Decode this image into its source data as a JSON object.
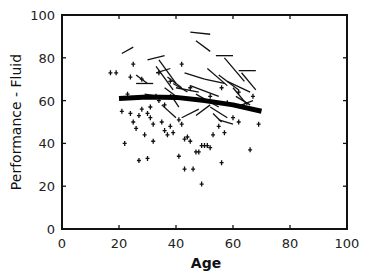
{
  "chart_data": {
    "type": "scatter",
    "title": "",
    "xlabel": "Age",
    "ylabel": "Performance - Fluid",
    "xlim": [
      0,
      100
    ],
    "ylim": [
      0,
      100
    ],
    "xticks": [
      0,
      20,
      40,
      60,
      80,
      100
    ],
    "yticks": [
      0,
      20,
      40,
      60,
      80,
      100
    ],
    "grid": false,
    "legend": null,
    "series": [
      {
        "name": "single observations",
        "marker": "plus",
        "points": [
          [
            17,
            73
          ],
          [
            19,
            73
          ],
          [
            21,
            55
          ],
          [
            24,
            54
          ],
          [
            25,
            50
          ],
          [
            26,
            47
          ],
          [
            27,
            53
          ],
          [
            28,
            56
          ],
          [
            29,
            44
          ],
          [
            30,
            54
          ],
          [
            31,
            57
          ],
          [
            31,
            52
          ],
          [
            32,
            49
          ],
          [
            32,
            41
          ],
          [
            33,
            62
          ],
          [
            34,
            60
          ],
          [
            35,
            50
          ],
          [
            36,
            46
          ],
          [
            37,
            44
          ],
          [
            38,
            48
          ],
          [
            39,
            45
          ],
          [
            41,
            51
          ],
          [
            42,
            49
          ],
          [
            43,
            42
          ],
          [
            44,
            43
          ],
          [
            45,
            41
          ],
          [
            47,
            36
          ],
          [
            48,
            36
          ],
          [
            49,
            39
          ],
          [
            50,
            39
          ],
          [
            51,
            39
          ],
          [
            52,
            38
          ],
          [
            53,
            44
          ],
          [
            55,
            48
          ],
          [
            56,
            31
          ],
          [
            57,
            45
          ],
          [
            60,
            52
          ],
          [
            62,
            50
          ],
          [
            66,
            37
          ],
          [
            69,
            49
          ],
          [
            22,
            40
          ],
          [
            27,
            32
          ],
          [
            30,
            33
          ],
          [
            43,
            28
          ],
          [
            46,
            28
          ],
          [
            49,
            21
          ],
          [
            41,
            34
          ],
          [
            36,
            58
          ],
          [
            23,
            63
          ],
          [
            24,
            71
          ],
          [
            25,
            77
          ],
          [
            28,
            70
          ],
          [
            34,
            73
          ],
          [
            38,
            69
          ],
          [
            42,
            77
          ],
          [
            45,
            66
          ],
          [
            52,
            62
          ],
          [
            56,
            66
          ],
          [
            58,
            59
          ],
          [
            62,
            64
          ],
          [
            64,
            57
          ],
          [
            67,
            62
          ]
        ]
      },
      {
        "name": "longitudinal change segments",
        "marker": "line",
        "segments": [
          [
            [
              21,
              82
            ],
            [
              25,
              85
            ]
          ],
          [
            [
              30,
              79
            ],
            [
              36,
              81
            ]
          ],
          [
            [
              45,
              92
            ],
            [
              52,
              91
            ]
          ],
          [
            [
              47,
              88
            ],
            [
              52,
              83
            ]
          ],
          [
            [
              54,
              81
            ],
            [
              60,
              81
            ]
          ],
          [
            [
              62,
              74
            ],
            [
              68,
              74
            ]
          ],
          [
            [
              26,
              68
            ],
            [
              32,
              68
            ]
          ],
          [
            [
              26,
              72
            ],
            [
              30,
              68
            ]
          ],
          [
            [
              33,
              73
            ],
            [
              38,
              75
            ]
          ],
          [
            [
              33,
              76
            ],
            [
              39,
              65
            ]
          ],
          [
            [
              34,
              79
            ],
            [
              40,
              68
            ]
          ],
          [
            [
              37,
              71
            ],
            [
              42,
              66
            ]
          ],
          [
            [
              39,
              68
            ],
            [
              44,
              64
            ]
          ],
          [
            [
              29,
              63
            ],
            [
              38,
              61
            ]
          ],
          [
            [
              40,
              66
            ],
            [
              48,
              64
            ]
          ],
          [
            [
              43,
              73
            ],
            [
              50,
              70
            ]
          ],
          [
            [
              45,
              67
            ],
            [
              55,
              62
            ]
          ],
          [
            [
              47,
              63
            ],
            [
              55,
              57
            ]
          ],
          [
            [
              50,
              70
            ],
            [
              57,
              68
            ]
          ],
          [
            [
              51,
              75
            ],
            [
              58,
              67
            ]
          ],
          [
            [
              55,
              72
            ],
            [
              62,
              65
            ]
          ],
          [
            [
              57,
              80
            ],
            [
              64,
              69
            ]
          ],
          [
            [
              58,
              69
            ],
            [
              66,
              64
            ]
          ],
          [
            [
              60,
              66
            ],
            [
              65,
              58
            ]
          ],
          [
            [
              61,
              62
            ],
            [
              66,
              58
            ]
          ],
          [
            [
              63,
              73
            ],
            [
              68,
              65
            ]
          ],
          [
            [
              35,
              58
            ],
            [
              40,
              52
            ]
          ],
          [
            [
              42,
              52
            ],
            [
              48,
              56
            ]
          ],
          [
            [
              47,
              53
            ],
            [
              52,
              58
            ]
          ],
          [
            [
              52,
              57
            ],
            [
              58,
              52
            ]
          ],
          [
            [
              53,
              54
            ],
            [
              56,
              50
            ]
          ],
          [
            [
              55,
              51
            ],
            [
              60,
              49
            ]
          ],
          [
            [
              61,
              57
            ],
            [
              67,
              60
            ]
          ],
          [
            [
              38,
              63
            ],
            [
              41,
              57
            ]
          ],
          [
            [
              36,
              66
            ],
            [
              40,
              62
            ]
          ]
        ]
      },
      {
        "name": "fitted trend",
        "marker": "thick-line",
        "points": [
          [
            20,
            61
          ],
          [
            30,
            61.7
          ],
          [
            40,
            61.5
          ],
          [
            50,
            60
          ],
          [
            60,
            58
          ],
          [
            70,
            55
          ]
        ]
      }
    ]
  }
}
